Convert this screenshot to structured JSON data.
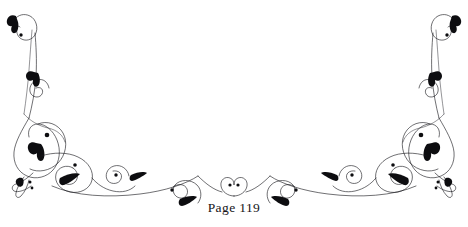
{
  "page": {
    "label": "Page 119",
    "background_color": "#ffffff",
    "ink_color": "#0d0d10",
    "stroke_color": "#17171b"
  },
  "ornament": {
    "name": "calligraphic-page-footer-flourish",
    "symmetry": "bilateral-vertical-mirror",
    "axis_x": 234,
    "left_side": {
      "top_crook_label": "top-left-crook-terminal",
      "upper_spiral_label": "upper-left-spiral",
      "body_loop_label": "left-body-loop",
      "lower_scroll_label": "lower-left-scroll",
      "ribbon_tail_label": "left-ribbon-tail-terminal"
    },
    "right_side": {
      "top_crook_label": "top-right-crook-terminal",
      "upper_spiral_label": "upper-right-spiral",
      "body_loop_label": "right-body-loop",
      "lower_scroll_label": "lower-right-scroll",
      "ribbon_tail_label": "right-ribbon-tail-terminal"
    },
    "center": {
      "motif_label": "center-heart-loop-motif",
      "dot_count": 2
    },
    "leaf_count": 16,
    "dot_count": 12
  }
}
